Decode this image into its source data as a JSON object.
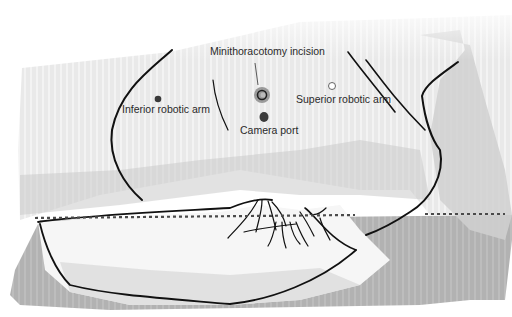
{
  "diagram": {
    "labels": {
      "minithoracotomy": "Minithoracotomy incision",
      "inferior_arm": "Inferior robotic arm",
      "superior_arm": "Superior robotic arm",
      "camera_port": "Camera port"
    },
    "markers": [
      {
        "id": "minithoracotomy",
        "type": "incision-ring",
        "x": 262,
        "y": 95
      },
      {
        "id": "camera_port",
        "type": "filled-dot",
        "x": 264,
        "y": 117
      },
      {
        "id": "inferior_arm",
        "type": "filled-dot",
        "x": 158,
        "y": 99
      },
      {
        "id": "superior_arm",
        "type": "open-circle",
        "x": 332,
        "y": 86
      }
    ],
    "colors": {
      "skin_light": "#ececec",
      "skin_mid": "#d6d6d6",
      "shadow": "#bdbdbd",
      "table": "#a9a9a9",
      "sheet_white": "#f7f7f7",
      "outline": "#111111",
      "marker_dark": "#3a3a3a",
      "incision_ring": "#8a8a8a",
      "dashed_line": "#555555",
      "text": "#2a2a2a"
    }
  }
}
